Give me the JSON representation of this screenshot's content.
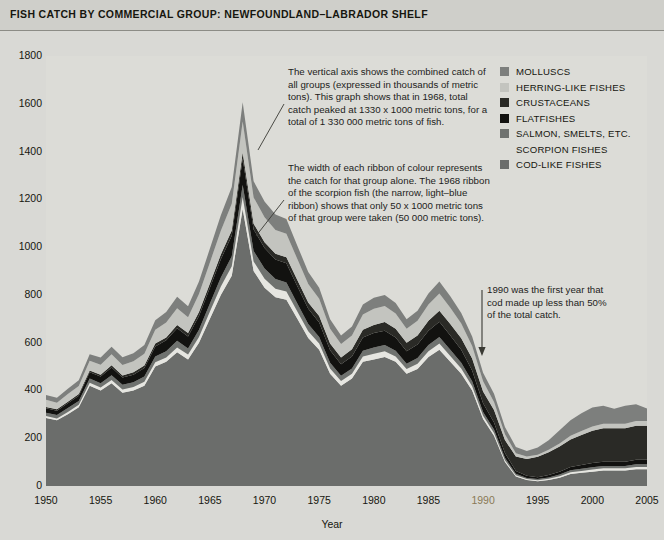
{
  "title": "FISH CATCH BY COMMERCIAL GROUP: NEWFOUNDLAND–LABRADOR SHELF",
  "axes": {
    "ylabel": "Catch (metric tons x 1000)",
    "xlabel": "Year",
    "yticks": [
      "0",
      "200",
      "400",
      "600",
      "800",
      "1000",
      "1200",
      "1400",
      "1600",
      "1800"
    ],
    "xticks": [
      "1950",
      "1955",
      "1960",
      "1965",
      "1970",
      "1975",
      "1980",
      "1985",
      "1990",
      "1995",
      "2000",
      "2005"
    ]
  },
  "legend": [
    {
      "label": "MOLLUSCS",
      "color": "#7d7f7d",
      "swatch": true
    },
    {
      "label": "HERRING-LIKE FISHES",
      "color": "#c3c4bf",
      "swatch": true
    },
    {
      "label": "CRUSTACEANS",
      "color": "#2a2a26",
      "swatch": true
    },
    {
      "label": "FLATFISHES",
      "color": "#121210",
      "swatch": true
    },
    {
      "label": "SALMON, SMELTS, ETC.",
      "color": "#6f726f",
      "swatch": true
    },
    {
      "label": "SCORPION FISHES",
      "color": "#dcdcd7",
      "swatch": false
    },
    {
      "label": "COD-LIKE FISHES",
      "color": "#6b6d6b",
      "swatch": true
    }
  ],
  "annotations": {
    "a1": "The vertical axis shows the combined catch of all groups (expressed in thousands of metric tons). This graph shows that in 1968, total catch peaked at 1330 x 1000 metric tons, for a total of 1 330 000 metric tons of fish.",
    "a2": "The width of each ribbon of colour represents the catch for that group alone. The 1968 ribbon of the scorpion fish (the narrow, light–blue ribbon) shows that only 50 x 1000 metric tons of that group were taken (50 000 metric tons).",
    "a3": "1990 was the first year that cod made up less than 50% of the total catch."
  },
  "colors": {
    "page_background": "#d9d9d5",
    "title_background": "#cfcfca",
    "plot_background": "#dcdcd7",
    "axis": "#4a4a46",
    "text": "#16160f",
    "highlight_tick": "#8a7a55"
  },
  "chart_data": {
    "type": "area",
    "title": "FISH CATCH BY COMMERCIAL GROUP: NEWFOUNDLAND–LABRADOR SHELF",
    "xlabel": "Year",
    "ylabel": "Catch (metric tons x 1000)",
    "xlim": [
      1950,
      2005
    ],
    "ylim": [
      0,
      1800
    ],
    "grid": false,
    "legend_position": "top-right",
    "stacked": true,
    "stack_order_bottom_to_top": [
      "COD-LIKE FISHES",
      "SCORPION FISHES",
      "SALMON, SMELTS, ETC.",
      "FLATFISHES",
      "CRUSTACEANS",
      "HERRING-LIKE FISHES",
      "MOLLUSCS"
    ],
    "x": [
      1950,
      1951,
      1952,
      1953,
      1954,
      1955,
      1956,
      1957,
      1958,
      1959,
      1960,
      1961,
      1962,
      1963,
      1964,
      1965,
      1966,
      1967,
      1968,
      1969,
      1970,
      1971,
      1972,
      1973,
      1974,
      1975,
      1976,
      1977,
      1978,
      1979,
      1980,
      1981,
      1982,
      1983,
      1984,
      1985,
      1986,
      1987,
      1988,
      1989,
      1990,
      1991,
      1992,
      1993,
      1994,
      1995,
      1996,
      1997,
      1998,
      1999,
      2000,
      2001,
      2002,
      2003,
      2004,
      2005
    ],
    "series": [
      {
        "name": "COD-LIKE FISHES",
        "color": "#6b6d6b",
        "values": [
          285,
          275,
          300,
          330,
          420,
          400,
          430,
          390,
          400,
          420,
          500,
          520,
          560,
          530,
          600,
          700,
          800,
          880,
          1160,
          900,
          830,
          790,
          780,
          700,
          620,
          570,
          470,
          420,
          450,
          520,
          530,
          540,
          520,
          470,
          490,
          540,
          570,
          520,
          470,
          400,
          280,
          210,
          100,
          40,
          25,
          20,
          25,
          35,
          50,
          55,
          60,
          65,
          65,
          65,
          70,
          70
        ]
      },
      {
        "name": "SCORPION FISHES",
        "color": "#e6e6e1",
        "values": [
          8,
          8,
          10,
          10,
          12,
          12,
          14,
          14,
          14,
          16,
          18,
          18,
          20,
          20,
          24,
          30,
          35,
          40,
          50,
          40,
          38,
          36,
          34,
          30,
          28,
          26,
          22,
          20,
          20,
          22,
          24,
          24,
          22,
          20,
          22,
          24,
          26,
          24,
          22,
          18,
          14,
          12,
          8,
          5,
          4,
          4,
          5,
          6,
          8,
          8,
          9,
          9,
          9,
          9,
          10,
          10
        ]
      },
      {
        "name": "SALMON, SMELTS, ETC.",
        "color": "#6f726f",
        "values": [
          14,
          14,
          16,
          16,
          18,
          18,
          20,
          20,
          20,
          22,
          24,
          26,
          28,
          26,
          30,
          34,
          38,
          42,
          50,
          44,
          42,
          40,
          38,
          34,
          30,
          28,
          24,
          22,
          22,
          24,
          26,
          26,
          24,
          22,
          24,
          26,
          28,
          26,
          24,
          20,
          16,
          14,
          10,
          6,
          5,
          5,
          6,
          7,
          8,
          9,
          10,
          10,
          10,
          10,
          11,
          11
        ]
      },
      {
        "name": "FLATFISHES",
        "color": "#121210",
        "values": [
          18,
          18,
          20,
          22,
          26,
          28,
          32,
          30,
          32,
          36,
          42,
          46,
          52,
          50,
          58,
          66,
          76,
          86,
          110,
          90,
          86,
          82,
          80,
          72,
          64,
          60,
          52,
          48,
          50,
          56,
          60,
          60,
          56,
          52,
          56,
          60,
          64,
          60,
          54,
          46,
          36,
          30,
          20,
          12,
          9,
          8,
          10,
          12,
          14,
          16,
          17,
          18,
          18,
          18,
          19,
          19
        ]
      },
      {
        "name": "CRUSTACEANS",
        "color": "#2a2a26",
        "values": [
          6,
          6,
          7,
          7,
          8,
          8,
          9,
          9,
          10,
          10,
          12,
          12,
          14,
          14,
          16,
          18,
          20,
          22,
          26,
          24,
          24,
          24,
          26,
          26,
          26,
          28,
          28,
          28,
          30,
          32,
          34,
          36,
          36,
          36,
          38,
          42,
          46,
          48,
          48,
          50,
          50,
          52,
          55,
          60,
          70,
          85,
          95,
          105,
          115,
          125,
          135,
          140,
          140,
          140,
          142,
          142
        ]
      },
      {
        "name": "HERRING-LIKE FISHES",
        "color": "#c3c4bf",
        "values": [
          30,
          28,
          32,
          34,
          40,
          42,
          46,
          44,
          46,
          50,
          58,
          62,
          70,
          66,
          76,
          88,
          100,
          112,
          130,
          110,
          105,
          100,
          98,
          88,
          78,
          72,
          62,
          56,
          58,
          64,
          68,
          68,
          64,
          58,
          62,
          68,
          72,
          68,
          62,
          52,
          42,
          34,
          24,
          14,
          10,
          9,
          11,
          13,
          15,
          17,
          18,
          19,
          19,
          19,
          20,
          20
        ]
      },
      {
        "name": "MOLLUSCS",
        "color": "#7d7f7d",
        "values": [
          20,
          20,
          22,
          24,
          28,
          30,
          32,
          32,
          34,
          36,
          40,
          44,
          48,
          46,
          52,
          58,
          64,
          70,
          80,
          68,
          66,
          64,
          62,
          56,
          50,
          46,
          40,
          36,
          38,
          42,
          46,
          46,
          44,
          40,
          42,
          46,
          50,
          48,
          44,
          40,
          36,
          34,
          30,
          26,
          24,
          30,
          40,
          55,
          65,
          75,
          80,
          75,
          62,
          75,
          70,
          52
        ]
      }
    ],
    "notes": [
      {
        "year": 1968,
        "text": "Total catch peaked at 1330 x 1000 metric tons"
      },
      {
        "year": 1990,
        "text": "First year that cod made up less than 50% of the total catch"
      }
    ]
  }
}
